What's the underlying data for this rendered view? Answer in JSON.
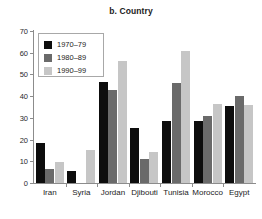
{
  "chart_data": {
    "type": "bar",
    "title": "b. Country",
    "xlabel": "",
    "ylabel": "",
    "ylim": [
      0,
      70
    ],
    "yticks": [
      0,
      10,
      20,
      30,
      40,
      50,
      60,
      70
    ],
    "grid": false,
    "legend_position": "top-left",
    "categories": [
      "Iran",
      "Syria",
      "Jordan",
      "Djibouti",
      "Tunisia",
      "Morocco",
      "Egypt"
    ],
    "series": [
      {
        "name": "1970–79",
        "color": "#0d0d0d",
        "values": [
          18.5,
          5.5,
          46.5,
          25.5,
          28.5,
          28.5,
          35.5
        ]
      },
      {
        "name": "1980–89",
        "color": "#6a6a6a",
        "values": [
          6.5,
          0,
          43.0,
          11.0,
          46.0,
          31.0,
          40.0
        ]
      },
      {
        "name": "1990–99",
        "color": "#c6c6c6",
        "values": [
          9.5,
          15.0,
          56.0,
          14.5,
          61.0,
          36.5,
          36.0
        ]
      }
    ]
  }
}
